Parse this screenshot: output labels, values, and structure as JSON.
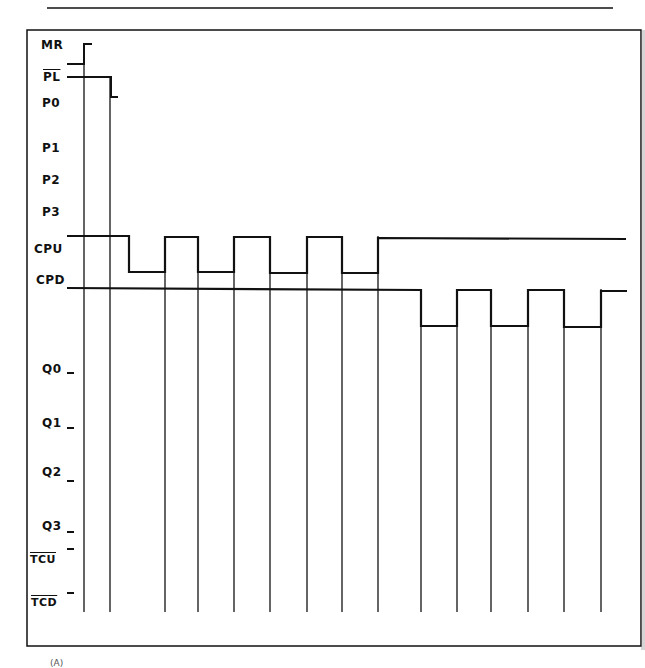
{
  "diagram": {
    "type": "timing-diagram",
    "colors": {
      "line": "#111111",
      "background": "#ffffff"
    },
    "signals": [
      {
        "name": "MR",
        "overbar": false,
        "label_x": 41,
        "label_y": 38
      },
      {
        "name": "PL",
        "overbar": true,
        "label_x": 43,
        "label_y": 70
      },
      {
        "name": "P0",
        "overbar": false,
        "label_x": 42,
        "label_y": 96
      },
      {
        "name": "P1",
        "overbar": false,
        "label_x": 42,
        "label_y": 141
      },
      {
        "name": "P2",
        "overbar": false,
        "label_x": 42,
        "label_y": 173
      },
      {
        "name": "P3",
        "overbar": false,
        "label_x": 42,
        "label_y": 205
      },
      {
        "name": "CPU",
        "overbar": false,
        "label_x": 34,
        "label_y": 242
      },
      {
        "name": "CPD",
        "overbar": false,
        "label_x": 36,
        "label_y": 273
      },
      {
        "name": "Q0",
        "overbar": false,
        "label_x": 42,
        "label_y": 362
      },
      {
        "name": "Q1",
        "overbar": false,
        "label_x": 42,
        "label_y": 416
      },
      {
        "name": "Q2",
        "overbar": false,
        "label_x": 42,
        "label_y": 465
      },
      {
        "name": "Q3",
        "overbar": false,
        "label_x": 42,
        "label_y": 519
      },
      {
        "name": "TCU",
        "overbar": true,
        "label_x": 30,
        "label_y": 553
      },
      {
        "name": "TCD",
        "overbar": true,
        "label_x": 31,
        "label_y": 596
      }
    ],
    "footer_note": "(A)"
  }
}
